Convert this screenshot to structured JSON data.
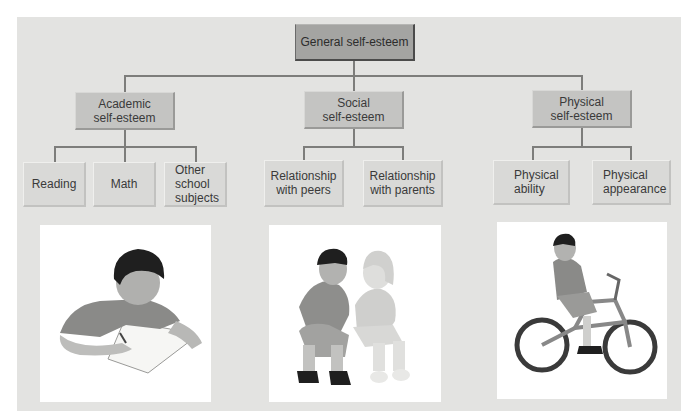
{
  "diagram": {
    "title_node": "General self-esteem",
    "categories": [
      {
        "label": "Academic\nself-esteem",
        "children": [
          "Reading",
          "Math",
          "Other\nschool\nsubjects"
        ],
        "illustration": "boy-writing-in-notebook"
      },
      {
        "label": "Social\nself-esteem",
        "children": [
          "Relationship\nwith peers",
          "Relationship\nwith parents"
        ],
        "illustration": "boy-and-girl-sitting-talking"
      },
      {
        "label": "Physical\nself-esteem",
        "children": [
          "Physical\nability",
          "Physical\nappearance"
        ],
        "illustration": "boy-riding-bicycle"
      }
    ]
  },
  "colors": {
    "background": "#e3e3e1",
    "root_box": "#a4a4a2",
    "category_box": "#c4c4c2",
    "leaf_box": "#d9d9d7",
    "connector": "#7d7d7b"
  }
}
